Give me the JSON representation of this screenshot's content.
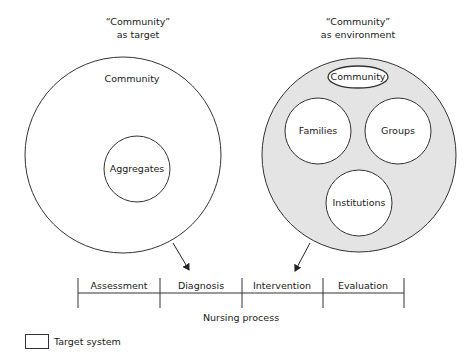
{
  "left_panel": {
    "title_line1": "“Community”",
    "title_line2": "as target",
    "outer_label": "Community",
    "inner_label": "Aggregates"
  },
  "right_panel": {
    "title_line1": "“Community”",
    "title_line2": "as environment",
    "oval_label": "Community",
    "circles": [
      "Families",
      "Groups",
      "Institutions"
    ]
  },
  "nursing_process": {
    "steps": [
      "Assessment",
      "Diagnosis",
      "Intervention",
      "Evaluation"
    ],
    "label": "Nursing process"
  },
  "legend": {
    "label": "Target system"
  },
  "colors": {
    "environment_fill": "#e4e4e4",
    "stroke": "#333333"
  }
}
